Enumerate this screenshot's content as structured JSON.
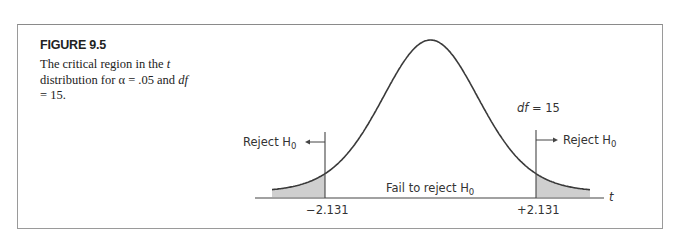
{
  "figure": {
    "title": "FIGURE 9.5",
    "caption_part1": "The critical region in the ",
    "caption_t": "t",
    "caption_part2": " distribution for α = .05 and ",
    "caption_df": "df",
    "caption_part3": " = 15."
  },
  "chart_data": {
    "type": "area",
    "title": "The critical region in the t distribution for α = .05 and df = 15",
    "distribution": "t",
    "df": 15,
    "alpha": 0.05,
    "tails": 2,
    "critical_values": [
      -2.131,
      2.131
    ],
    "xlabel": "t",
    "annotations": {
      "df_label": "df = 15",
      "reject_left": "Reject H0",
      "reject_right": "Reject H0",
      "fail_to_reject": "Fail to reject H0",
      "tick_left": "−2.131",
      "tick_right": "+2.131"
    },
    "shaded_regions": [
      {
        "from": "-inf",
        "to": -2.131,
        "label": "Reject H0"
      },
      {
        "from": 2.131,
        "to": "inf",
        "label": "Reject H0"
      }
    ],
    "colors": {
      "curve": "#3a3a3a",
      "shade": "#cfcfcf",
      "axis": "#444444"
    }
  },
  "labels": {
    "reject": "Reject H",
    "sub0": "0",
    "fail": "Fail to reject H",
    "df_italic": "df",
    "df_value": " = 15",
    "t_axis": "t",
    "tick_left": "−2.131",
    "tick_right": "+2.131"
  }
}
